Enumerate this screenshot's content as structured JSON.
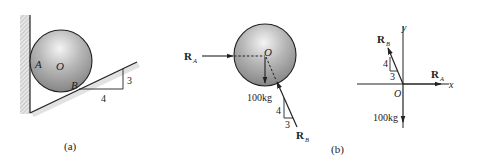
{
  "figure": {
    "panel_a": {
      "caption": "(a)",
      "labels": {
        "contact_wall": "A",
        "center": "O",
        "contact_incline": "B"
      },
      "slope": {
        "rise": "3",
        "run": "4"
      }
    },
    "panel_b": {
      "caption": "(b)",
      "sphere_diagram": {
        "force_a": {
          "main": "R",
          "sub": "A"
        },
        "force_b": {
          "main": "R",
          "sub": "B"
        },
        "center": "O",
        "weight": "100kg",
        "slope": {
          "rise": "4",
          "run": "3"
        }
      },
      "free_body_diagram": {
        "x_axis": "x",
        "y_axis": "y",
        "origin": "O",
        "force_a": {
          "main": "R",
          "sub": "A"
        },
        "force_b": {
          "main": "R",
          "sub": "B"
        },
        "weight": "100kg",
        "slope": {
          "rise": "4",
          "run": "3"
        }
      }
    }
  },
  "colors": {
    "line": "#222222",
    "sphere_light": "#eeeeee",
    "sphere_dark": "#8a8a8a",
    "hatch": "#b5b5b5"
  }
}
